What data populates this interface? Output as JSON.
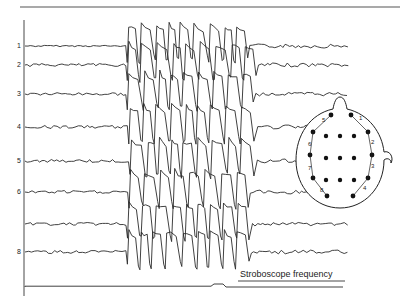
{
  "chart_data": {
    "type": "line",
    "title": "",
    "xlabel": "",
    "ylabel": "",
    "grid": false,
    "channels": [
      {
        "label": "1",
        "baseline_y": 46
      },
      {
        "label": "2",
        "baseline_y": 65
      },
      {
        "label": "3",
        "baseline_y": 94
      },
      {
        "label": "4",
        "baseline_y": 127
      },
      {
        "label": "5",
        "baseline_y": 161
      },
      {
        "label": "6",
        "baseline_y": 192
      },
      {
        "label": "",
        "baseline_y": 224
      },
      {
        "label": "8",
        "baseline_y": 252
      }
    ],
    "segments": {
      "background_end_x": 125,
      "discharge_start_x": 125,
      "discharge_end_x": 245,
      "trace_end_x": 345
    },
    "stroboscope": {
      "label": "Stroboscope frequency",
      "baseline_y": 287,
      "step_x": 214,
      "step_height": 3
    },
    "montage": {
      "pair_labels": [
        "1",
        "2",
        "3",
        "4",
        "5",
        "6",
        "7",
        "8"
      ],
      "inner_grid": "3x3 electrodes"
    }
  },
  "header": {
    "caption_fragment": "— (cropped caption text at top) —"
  }
}
